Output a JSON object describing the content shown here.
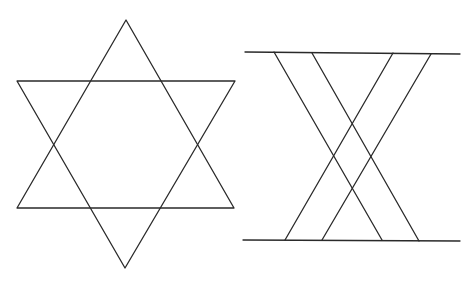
{
  "figures": [
    {
      "name": "hexagram",
      "description": "Six-pointed star formed by two overlapping equilateral triangles",
      "triangles": [
        {
          "name": "upward-triangle",
          "points": [
            [
              126,
              20
            ],
            [
              17,
              208
            ],
            [
              234,
              208
            ]
          ]
        },
        {
          "name": "downward-triangle",
          "points": [
            [
              17,
              81
            ],
            [
              235,
              81
            ],
            [
              125,
              268
            ]
          ]
        }
      ]
    },
    {
      "name": "crossing-lines",
      "description": "Two horizontal lines with four diagonal lines crossing between them",
      "horizontal_lines": [
        {
          "name": "top-line",
          "from": [
            245,
            52
          ],
          "to": [
            460,
            54
          ]
        },
        {
          "name": "bottom-line",
          "from": [
            243,
            240
          ],
          "to": [
            460,
            241
          ]
        }
      ],
      "diagonal_lines": [
        {
          "name": "diagonal-1",
          "from": [
            274,
            52
          ],
          "to": [
            382,
            240
          ]
        },
        {
          "name": "diagonal-2",
          "from": [
            312,
            53
          ],
          "to": [
            419,
            241
          ]
        },
        {
          "name": "diagonal-3",
          "from": [
            393,
            53
          ],
          "to": [
            285,
            240
          ]
        },
        {
          "name": "diagonal-4",
          "from": [
            431,
            54
          ],
          "to": [
            322,
            240
          ]
        }
      ]
    }
  ],
  "colors": {
    "stroke": "#2a2a2a",
    "background": "#ffffff"
  }
}
